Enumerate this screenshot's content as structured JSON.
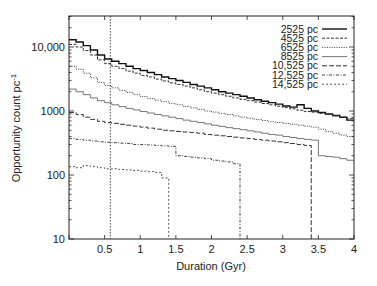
{
  "chart_data": {
    "type": "line",
    "subtype": "step",
    "title": "",
    "xlabel": "Duration (Gyr)",
    "ylabel": "Opportunity count pc",
    "ylabel_superscript": "-1",
    "xlim": [
      0,
      4
    ],
    "ylim": [
      10,
      30000
    ],
    "yscale": "log",
    "grid": false,
    "legend_position": "top-right",
    "x_ticks": [
      0.5,
      1,
      1.5,
      2,
      2.5,
      3,
      3.5,
      4
    ],
    "x_tick_labels": [
      "0.5",
      "1",
      "1.5",
      "2",
      "2.5",
      "3",
      "3.5",
      "4"
    ],
    "y_ticks": [
      10,
      100,
      1000,
      10000
    ],
    "y_tick_labels": [
      "10",
      "100",
      "1000",
      "10,000"
    ],
    "vertical_line": {
      "x": 0.58,
      "style": "dotted"
    },
    "x": [
      0.0,
      0.1,
      0.2,
      0.3,
      0.4,
      0.5,
      0.6,
      0.7,
      0.8,
      0.9,
      1.0,
      1.1,
      1.2,
      1.3,
      1.4,
      1.5,
      1.6,
      1.7,
      1.8,
      1.9,
      2.0,
      2.1,
      2.2,
      2.3,
      2.4,
      2.5,
      2.6,
      2.7,
      2.8,
      2.9,
      3.0,
      3.1,
      3.2,
      3.3,
      3.4,
      3.5,
      3.6,
      3.7,
      3.8,
      3.9
    ],
    "series": [
      {
        "name": "2525 pc",
        "style": "solid-thick",
        "stop_x": 4.0,
        "values": [
          13000,
          12000,
          10500,
          9000,
          7500,
          6500,
          6000,
          5500,
          5000,
          4600,
          4300,
          4000,
          3700,
          3400,
          3200,
          3000,
          2800,
          2600,
          2450,
          2300,
          2150,
          2000,
          1900,
          1800,
          1700,
          1600,
          1500,
          1420,
          1350,
          1280,
          1200,
          1150,
          1250,
          1100,
          1000,
          950,
          900,
          850,
          800,
          720
        ]
      },
      {
        "name": "4525 pc",
        "style": "dashed",
        "stop_x": 4.0,
        "values": [
          11000,
          10000,
          8800,
          7500,
          6300,
          5500,
          5000,
          4600,
          4200,
          3900,
          3600,
          3400,
          3150,
          2950,
          2750,
          2600,
          2450,
          2300,
          2150,
          2000,
          1900,
          1800,
          1700,
          1600,
          1520,
          1450,
          1380,
          1310,
          1250,
          1190,
          1130,
          1080,
          1030,
          980,
          960,
          920,
          880,
          840,
          800,
          760
        ]
      },
      {
        "name": "6525 pc",
        "style": "dotted",
        "stop_x": 4.0,
        "values": [
          5000,
          4500,
          3900,
          3300,
          2800,
          2500,
          2300,
          2100,
          1950,
          1800,
          1680,
          1570,
          1480,
          1400,
          1320,
          1250,
          1180,
          1120,
          1060,
          1000,
          960,
          920,
          880,
          840,
          800,
          770,
          740,
          710,
          680,
          660,
          640,
          620,
          600,
          580,
          560,
          520,
          480,
          450,
          420,
          400
        ]
      },
      {
        "name": "8525 pc",
        "style": "solid-thin",
        "stop_x": 4.0,
        "values": [
          2200,
          2000,
          1800,
          1600,
          1450,
          1350,
          1250,
          1170,
          1100,
          1040,
          980,
          930,
          880,
          840,
          800,
          760,
          720,
          690,
          660,
          630,
          600,
          575,
          550,
          530,
          510,
          490,
          470,
          450,
          430,
          420,
          400,
          385,
          370,
          360,
          350,
          200,
          195,
          190,
          180,
          170
        ]
      },
      {
        "name": "10,525 pc",
        "style": "long-dash",
        "stop_x": 3.4,
        "values": [
          950,
          880,
          800,
          740,
          690,
          660,
          640,
          620,
          600,
          580,
          560,
          540,
          520,
          500,
          490,
          480,
          470,
          460,
          450,
          430,
          420,
          410,
          400,
          390,
          380,
          370,
          360,
          350,
          340,
          330,
          320,
          310,
          300,
          290,
          null,
          null,
          null,
          null,
          null,
          null
        ]
      },
      {
        "name": "12,525 pc",
        "style": "dash-dot",
        "stop_x": 2.4,
        "values": [
          370,
          360,
          350,
          340,
          330,
          325,
          320,
          315,
          310,
          300,
          300,
          295,
          290,
          285,
          280,
          200,
          195,
          190,
          185,
          180,
          170,
          165,
          160,
          150,
          null,
          null,
          null,
          null,
          null,
          null,
          null,
          null,
          null,
          null,
          null,
          null,
          null,
          null,
          null,
          null
        ]
      },
      {
        "name": "14,525 pc",
        "style": "short-dash",
        "stop_x": 1.4,
        "values": [
          135,
          130,
          140,
          135,
          130,
          125,
          125,
          122,
          120,
          118,
          115,
          113,
          110,
          90,
          null,
          null,
          null,
          null,
          null,
          null,
          null,
          null,
          null,
          null,
          null,
          null,
          null,
          null,
          null,
          null,
          null,
          null,
          null,
          null,
          null,
          null,
          null,
          null,
          null,
          null
        ]
      }
    ]
  }
}
